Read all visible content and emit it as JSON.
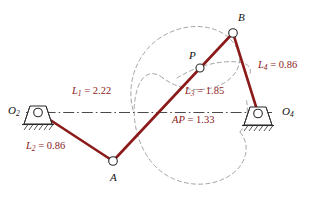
{
  "diagram": {
    "colors": {
      "link": "#8B1A1A",
      "ground": "#2b2b2b",
      "centerline": "#4a4a4a",
      "coupler_curve": "#9a9a9a",
      "joint_fill": "#ffffff",
      "text": "#111111",
      "dim_text": "#8B1A1A"
    },
    "joints": [
      {
        "name": "O2",
        "label": "O",
        "subscript": "2",
        "x": 38,
        "y": 112,
        "type": "ground-pivot"
      },
      {
        "name": "A",
        "label": "A",
        "subscript": "",
        "x": 113,
        "y": 161,
        "type": "pin"
      },
      {
        "name": "B",
        "label": "B",
        "subscript": "",
        "x": 233,
        "y": 33,
        "type": "pin"
      },
      {
        "name": "P",
        "label": "P",
        "subscript": "",
        "x": 200,
        "y": 68,
        "type": "coupler-point"
      },
      {
        "name": "O4",
        "label": "O",
        "subscript": "4",
        "x": 258,
        "y": 113,
        "type": "ground-pivot"
      }
    ],
    "links": [
      {
        "name": "L2",
        "from": "O2",
        "to": "A"
      },
      {
        "name": "L3",
        "from": "A",
        "to": "B"
      },
      {
        "name": "L4",
        "from": "B",
        "to": "O4"
      },
      {
        "name": "L1",
        "from": "O2",
        "to": "O4",
        "style": "centerline"
      }
    ],
    "dimensions": [
      {
        "name": "L1",
        "symbol": "L",
        "subscript": "1",
        "value": "2.22",
        "text": "L1 = 2.22",
        "x": 72,
        "y": 88
      },
      {
        "name": "L2",
        "symbol": "L",
        "subscript": "2",
        "value": "0.86",
        "text": "L2 = 0.86",
        "x": 26,
        "y": 143
      },
      {
        "name": "L3",
        "symbol": "L",
        "subscript": "3",
        "value": "1.85",
        "text": "L3 = 1.85",
        "x": 185,
        "y": 88
      },
      {
        "name": "L4",
        "symbol": "L",
        "subscript": "4",
        "value": "0.86",
        "text": "L4 = 0.86",
        "x": 258,
        "y": 62
      },
      {
        "name": "AP",
        "symbol": "AP",
        "subscript": "",
        "value": "1.33",
        "text": "AP = 1.33",
        "x": 172,
        "y": 117
      }
    ],
    "point_labels": [
      {
        "name": "O2-label",
        "x": 8,
        "y": 105
      },
      {
        "name": "O4-label",
        "x": 282,
        "y": 106
      },
      {
        "name": "A-label",
        "x": 110,
        "y": 172
      },
      {
        "name": "B-label",
        "x": 238,
        "y": 14
      },
      {
        "name": "P-label",
        "x": 189,
        "y": 52
      }
    ],
    "coupler_curve": {
      "description": "dashed closed coupler curve traced by point P",
      "style": "dashed"
    }
  }
}
